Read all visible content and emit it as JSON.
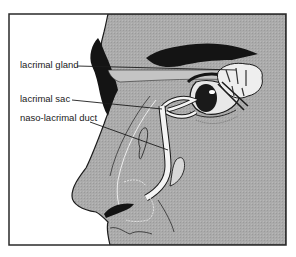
{
  "diagram": {
    "labels": [
      {
        "id": "lacrimal-gland",
        "text": "lacrimal gland"
      },
      {
        "id": "lacrimal-sac",
        "text": "lacrimal sac"
      },
      {
        "id": "naso-lacrimal-duct",
        "text": "naso-lacrimal duct"
      }
    ],
    "colors": {
      "skin": "#a9a9a9",
      "outline": "#1c1c1c",
      "hair": "#141414",
      "duct": "#f4f4f4",
      "background": "#ffffff"
    }
  }
}
